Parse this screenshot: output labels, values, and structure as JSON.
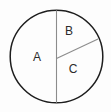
{
  "figure": {
    "type": "circle-sector-diagram",
    "background_color": "#fdfdfd",
    "outline_color": "#1e1e1e",
    "divider_color": "#8c8c8c",
    "label_color": "#2b2b2b",
    "circle": {
      "center_x": 56.5,
      "center_y": 56.5,
      "radius": 46.5,
      "stroke_width": 1.4
    },
    "dividers": [
      {
        "name": "vertical-diameter",
        "x1": 56.5,
        "y1": 10.0,
        "x2": 56.5,
        "y2": 103.0,
        "stroke_width": 1.1
      },
      {
        "name": "diagonal-radius",
        "x1": 56.5,
        "y1": 58.5,
        "x2": 98.0,
        "y2": 39.0,
        "stroke_width": 1.1
      }
    ],
    "sectors": [
      {
        "id": "A",
        "label": "A",
        "position": "left-half",
        "label_x": 37,
        "label_y": 57
      },
      {
        "id": "B",
        "label": "B",
        "position": "upper-right",
        "label_x": 69,
        "label_y": 31
      },
      {
        "id": "C",
        "label": "C",
        "position": "lower-right",
        "label_x": 73,
        "label_y": 69
      }
    ]
  }
}
